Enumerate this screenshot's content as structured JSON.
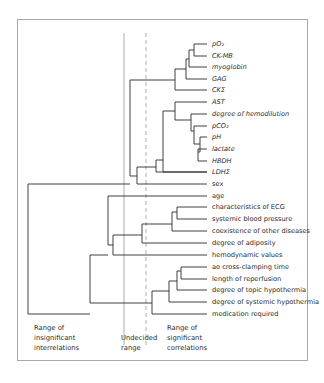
{
  "diagram": {
    "type": "dendrogram",
    "leaves": [
      {
        "id": "po2",
        "label": "pO₂",
        "italic": true
      },
      {
        "id": "ck_mb",
        "label": "CK-MB",
        "italic": true
      },
      {
        "id": "myoglobin",
        "label": "myoglobin",
        "italic": true
      },
      {
        "id": "gag",
        "label": "GAG",
        "italic": true
      },
      {
        "id": "ck_sigma",
        "label": "CKΣ",
        "italic": true
      },
      {
        "id": "ast",
        "label": "AST",
        "italic": true
      },
      {
        "id": "hemodilution",
        "label": "degree of hemodilution",
        "italic": true
      },
      {
        "id": "pco2",
        "label": "pCO₂",
        "italic": true
      },
      {
        "id": "ph",
        "label": "pH",
        "italic": true
      },
      {
        "id": "lactate",
        "label": "lactate",
        "italic": true
      },
      {
        "id": "hbdh",
        "label": "HBDH",
        "italic": true
      },
      {
        "id": "ldh_sigma",
        "label": "LDHΣ",
        "italic": true
      },
      {
        "id": "sex",
        "label": "sex",
        "italic": false
      },
      {
        "id": "age",
        "label": "age",
        "italic": false
      },
      {
        "id": "ecg",
        "label": "characteristics of ECG",
        "italic": false
      },
      {
        "id": "sbp",
        "label": "systemic blood pressure",
        "italic": false
      },
      {
        "id": "coexistence",
        "label": "coexistence of other diseases",
        "italic": false
      },
      {
        "id": "adiposity",
        "label": "degree of adiposity",
        "italic": false
      },
      {
        "id": "hemodynamic",
        "label": "hemodynamic values",
        "italic": false
      },
      {
        "id": "ao_clamp",
        "label": "ao cross-clamping time",
        "italic": false
      },
      {
        "id": "reperfusion",
        "label": "length of reperfusion",
        "italic": false
      },
      {
        "id": "topic_hypo",
        "label": "degree of topic hypothermia",
        "italic": false
      },
      {
        "id": "systemic_hypo",
        "label": "degree of systemic hypothermia",
        "italic": false
      },
      {
        "id": "medication",
        "label": "medication required",
        "italic": false
      }
    ],
    "leaf_y": [
      44,
      56,
      67,
      79,
      90,
      102,
      114,
      126,
      137,
      149,
      161,
      172,
      184,
      196,
      207,
      219,
      231,
      243,
      255,
      267,
      279,
      290,
      302,
      314
    ],
    "leaf_line_end_x": 207,
    "label_x": 212,
    "links": [
      {
        "x": 194,
        "from": [
          207,
          44
        ],
        "to": [
          207,
          56
        ],
        "join_y": 50
      },
      {
        "x": 189,
        "from": [
          194,
          50
        ],
        "to": [
          207,
          67
        ],
        "join_y": 59
      },
      {
        "x": 186,
        "from": [
          189,
          59
        ],
        "to": [
          207,
          79
        ],
        "join_y": 69
      },
      {
        "x": 175,
        "from": [
          186,
          69
        ],
        "to": [
          207,
          90
        ],
        "join_y": 80
      },
      {
        "x": 198,
        "from": [
          207,
          149
        ],
        "to": [
          207,
          161
        ],
        "join_y": 152
      },
      {
        "x": 200,
        "from": [
          207,
          137
        ],
        "to": [
          198,
          152
        ],
        "join_y": 144
      },
      {
        "x": 194,
        "from": [
          207,
          126
        ],
        "to": [
          200,
          144
        ],
        "join_y": 131
      },
      {
        "x": 191,
        "from": [
          207,
          114
        ],
        "to": [
          194,
          131
        ],
        "join_y": 120
      },
      {
        "x": 175,
        "from": [
          207,
          102
        ],
        "to": [
          191,
          120
        ],
        "join_y": 111
      },
      {
        "x": 163,
        "from": [
          175,
          111
        ],
        "to": [
          207,
          172
        ],
        "join_y": 160
      },
      {
        "x": 156,
        "from": [
          163,
          160
        ],
        "to": [
          207,
          172
        ],
        "join_y": 167
      },
      {
        "x": 137,
        "from": [
          156,
          167
        ],
        "to": [
          207,
          184
        ],
        "join_y": 176
      },
      {
        "x": 130,
        "from": [
          175,
          80
        ],
        "to": [
          137,
          176
        ],
        "join_y": 184
      },
      {
        "x": 177,
        "from": [
          207,
          207
        ],
        "to": [
          207,
          219
        ],
        "join_y": 212
      },
      {
        "x": 172,
        "from": [
          177,
          212
        ],
        "to": [
          207,
          231
        ],
        "join_y": 224
      },
      {
        "x": 142,
        "from": [
          172,
          224
        ],
        "to": [
          207,
          243
        ],
        "join_y": 235
      },
      {
        "x": 113,
        "from": [
          142,
          235
        ],
        "to": [
          207,
          255
        ],
        "join_y": 245
      },
      {
        "x": 108,
        "from": [
          207,
          196
        ],
        "to": [
          113,
          245
        ],
        "join_y": 255
      },
      {
        "x": 181,
        "from": [
          207,
          267
        ],
        "to": [
          207,
          279
        ],
        "join_y": 271
      },
      {
        "x": 177,
        "from": [
          181,
          271
        ],
        "to": [
          207,
          290
        ],
        "join_y": 281
      },
      {
        "x": 169,
        "from": [
          177,
          281
        ],
        "to": [
          207,
          302
        ],
        "join_y": 291
      },
      {
        "x": 152,
        "from": [
          169,
          291
        ],
        "to": [
          207,
          314
        ],
        "join_y": 303
      },
      {
        "x": 90,
        "from": [
          108,
          255
        ],
        "to": [
          152,
          303
        ],
        "join_y": 314
      },
      {
        "x": 28,
        "from": [
          130,
          184
        ],
        "to": [
          90,
          314
        ],
        "join_y": 314
      }
    ],
    "guides": {
      "solid_x": 124,
      "dashed_x": 146,
      "top_y": 33,
      "bottom_y": 345
    },
    "region_labels": {
      "insignificant": [
        "Range of",
        "insignificant",
        "interrelations"
      ],
      "undecided": [
        "Undecided",
        "range"
      ],
      "significant": [
        "Range of",
        "significant",
        "correlations"
      ]
    }
  }
}
